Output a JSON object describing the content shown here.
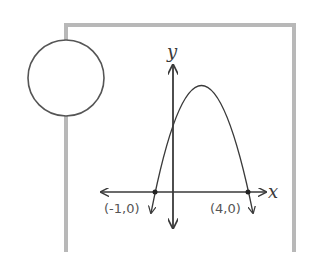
{
  "diagram": {
    "frame_color": "#b8b8b8",
    "line_color": "#3a3a3a",
    "circle": {
      "cx": 66,
      "cy": 78,
      "r": 38
    },
    "axes": {
      "x_label": "x",
      "y_label": "y"
    },
    "points": [
      {
        "label": "(-1,0)",
        "x": -1,
        "y": 0
      },
      {
        "label": "(4,0)",
        "x": 4,
        "y": 0
      }
    ],
    "curve": "downward-opening parabola with x-intercepts (-1,0) and (4,0)"
  }
}
